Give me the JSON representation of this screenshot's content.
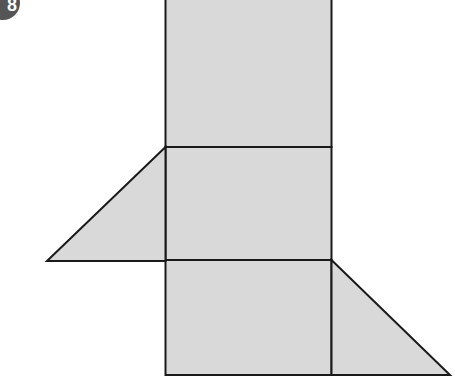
{
  "figure": {
    "label": "8",
    "fill_color": "#d9d9d9",
    "stroke_color": "#1a1a1a"
  }
}
